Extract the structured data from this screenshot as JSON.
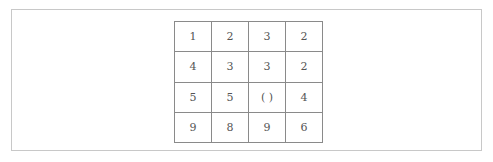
{
  "grid": {
    "rows": [
      [
        "1",
        "2",
        "3",
        "2"
      ],
      [
        "4",
        "3",
        "3",
        "2"
      ],
      [
        "5",
        "5",
        "(  )",
        "4"
      ],
      [
        "9",
        "8",
        "9",
        "6"
      ]
    ]
  }
}
